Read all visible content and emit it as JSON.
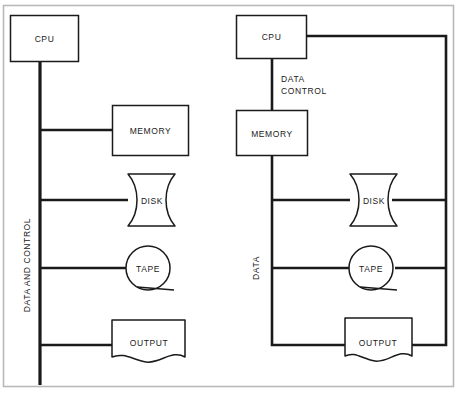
{
  "figure": {
    "frame_color": "#b8b8b8",
    "line_color": "#1a1a1a",
    "text_color": "#1a1a1a",
    "background": "#ffffff"
  },
  "diagrams": [
    {
      "id": "left",
      "bus_label": "DATA AND CONTROL",
      "bus_label_orientation": "vertical",
      "nodes": [
        {
          "label": "CPU",
          "shape": "rectangle"
        },
        {
          "label": "MEMORY",
          "shape": "rectangle"
        },
        {
          "label": "DISK",
          "shape": "magnetic-disk"
        },
        {
          "label": "TAPE",
          "shape": "magnetic-tape"
        },
        {
          "label": "OUTPUT",
          "shape": "document"
        }
      ]
    },
    {
      "id": "right",
      "bus_label_data": "DATA",
      "bus_label_control_line1": "DATA",
      "bus_label_control_line2": "CONTROL",
      "nodes": [
        {
          "label": "CPU",
          "shape": "rectangle"
        },
        {
          "label": "MEMORY",
          "shape": "rectangle"
        },
        {
          "label": "DISK",
          "shape": "magnetic-disk"
        },
        {
          "label": "TAPE",
          "shape": "magnetic-tape"
        },
        {
          "label": "OUTPUT",
          "shape": "document"
        }
      ]
    }
  ]
}
